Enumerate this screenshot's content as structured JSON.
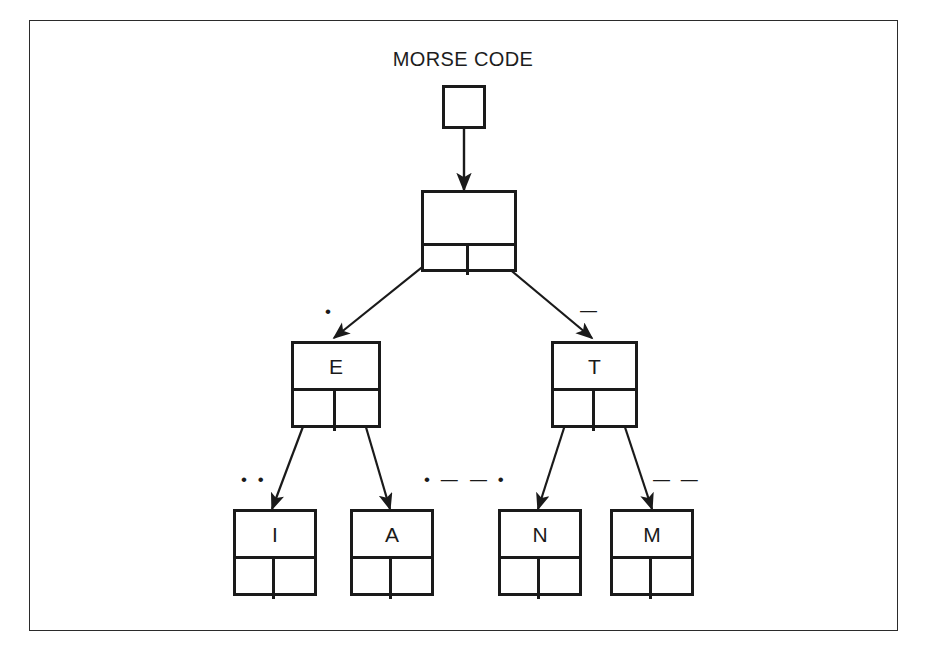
{
  "figure": {
    "title": "MORSE CODE",
    "stroke_color": "#1a1a1a",
    "frame_color": "#2b2b2b",
    "background": "#ffffff"
  },
  "tree": {
    "root": {
      "label": "",
      "id": "root"
    },
    "level1": {
      "label": "",
      "id": "node-empty"
    },
    "level2": [
      {
        "label": "E",
        "id": "node-e"
      },
      {
        "label": "T",
        "id": "node-t"
      }
    ],
    "level3": [
      {
        "label": "I",
        "id": "node-i"
      },
      {
        "label": "A",
        "id": "node-a"
      },
      {
        "label": "N",
        "id": "node-n"
      },
      {
        "label": "M",
        "id": "node-m"
      }
    ]
  },
  "edge_labels": {
    "e_branch": "•",
    "t_branch": "—",
    "i_branch": "• •",
    "a_branch": "• —",
    "n_branch": "— •",
    "m_branch": "— —"
  }
}
